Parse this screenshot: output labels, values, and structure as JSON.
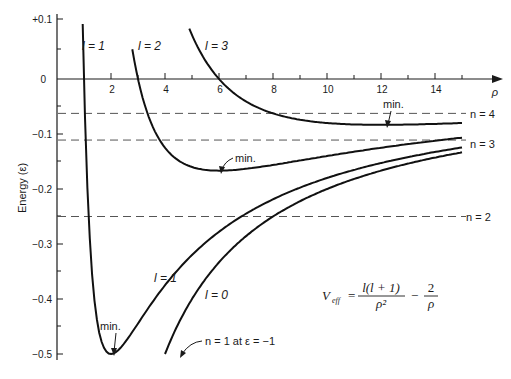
{
  "chart_data": {
    "type": "line",
    "title": "",
    "xlabel": "ρ",
    "ylabel": "Energy (ε)",
    "xlim": [
      0,
      16
    ],
    "ylim": [
      -0.5,
      0.1
    ],
    "grid": false,
    "x_ticks": [
      2,
      4,
      6,
      8,
      10,
      12,
      14
    ],
    "x_tick_labels": [
      "2",
      "4",
      "6",
      "8",
      "10",
      "12",
      "14"
    ],
    "y_ticks": [
      0.1,
      0,
      -0.1,
      -0.2,
      -0.3,
      -0.4,
      -0.5
    ],
    "y_tick_labels": [
      "+0.1",
      "0",
      "−0.1",
      "−0.2",
      "−0.3",
      "−0.4",
      "−0.5"
    ],
    "formula": "V_eff = l(l + 1)/ρ² − 2/ρ",
    "formula_parts": {
      "lhs": "V",
      "lhs_sub": "eff",
      "eq": "=",
      "num": "l(l + 1)",
      "den": "ρ²",
      "minus": "−",
      "num2": "2",
      "den2": "ρ"
    },
    "series": [
      {
        "name": "l = 0",
        "l": 0,
        "x": [
          4,
          5,
          6,
          7,
          8,
          9,
          10,
          11,
          12,
          13,
          14,
          15
        ],
        "y": [
          -0.5,
          -0.4,
          -0.333,
          -0.286,
          -0.25,
          -0.222,
          -0.2,
          -0.182,
          -0.167,
          -0.154,
          -0.143,
          -0.133
        ]
      },
      {
        "name": "l = 1",
        "l": 1,
        "x": [
          0.95,
          1,
          1.2,
          1.5,
          2,
          2.5,
          3,
          4,
          5,
          6,
          8,
          10,
          12,
          15
        ],
        "y": [
          0.1,
          0,
          -0.278,
          -0.444,
          -0.5,
          -0.48,
          -0.444,
          -0.375,
          -0.32,
          -0.278,
          -0.219,
          -0.18,
          -0.153,
          -0.124
        ]
      },
      {
        "name": "l = 2",
        "l": 2,
        "x": [
          2.79,
          3,
          3.5,
          4,
          5,
          6,
          7,
          8,
          10,
          12,
          15
        ],
        "y": [
          0.1,
          0,
          -0.082,
          -0.125,
          -0.16,
          -0.167,
          -0.163,
          -0.156,
          -0.14,
          -0.125,
          -0.107
        ]
      },
      {
        "name": "l = 3",
        "l": 3,
        "x": [
          4.9,
          5.5,
          6,
          7,
          8,
          9,
          10,
          11,
          12,
          13,
          14,
          15
        ],
        "y": [
          0.1,
          0.033,
          0,
          -0.041,
          -0.0625,
          -0.074,
          -0.08,
          -0.083,
          -0.0833,
          -0.083,
          -0.082,
          -0.08
        ]
      }
    ],
    "energy_levels": [
      {
        "name": "n = 2",
        "y": -0.25
      },
      {
        "name": "n = 3",
        "y": -0.111
      },
      {
        "name": "n = 4",
        "y": -0.0625
      }
    ],
    "annotations": [
      {
        "text": "min.",
        "x": 2,
        "y": -0.5,
        "target": "l = 1 minimum"
      },
      {
        "text": "min.",
        "x": 6,
        "y": -0.167,
        "target": "l = 2 minimum"
      },
      {
        "text": "min.",
        "x": 12,
        "y": -0.083,
        "target": "l = 3 minimum"
      },
      {
        "text": "n = 1 at ε = −1",
        "target": "l = 0 curve"
      }
    ]
  },
  "labels": {
    "l1_top": "l = 1",
    "l2_top": "l = 2",
    "l3_top": "l = 3",
    "l1_low": "l = 1",
    "l0_low": "l = 0",
    "n4": "n = 4",
    "n3": "n = 3",
    "n2": "n = 2",
    "min1": "min.",
    "min2": "min.",
    "min3": "min.",
    "n1": "n = 1 at ε = −1",
    "rho": "ρ",
    "ylabel": "Energy (ε)",
    "yt0": "+0.1",
    "yt1": "0",
    "yt2": "−0.1",
    "yt3": "−0.2",
    "yt4": "−0.3",
    "yt5": "−0.4",
    "yt6": "−0.5",
    "xt0": "2",
    "xt1": "4",
    "xt2": "6",
    "xt3": "8",
    "xt4": "10",
    "xt5": "12",
    "xt6": "14",
    "f_V": "V",
    "f_sub": "eff",
    "f_eq": "=",
    "f_num": "l(l + 1)",
    "f_den": "ρ²",
    "f_minus": "−",
    "f_num2": "2",
    "f_den2": "ρ"
  }
}
